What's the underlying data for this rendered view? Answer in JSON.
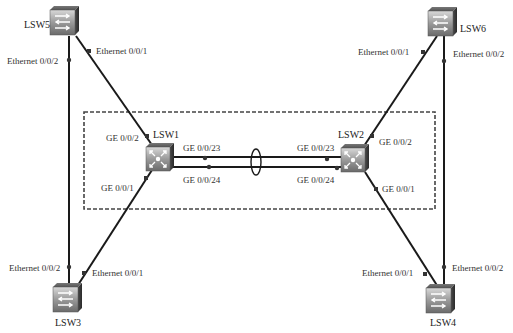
{
  "diagram": {
    "type": "network-topology",
    "group_box": {
      "style": "dashed",
      "contains": [
        "LSW1",
        "LSW2"
      ]
    },
    "devices": {
      "lsw1": {
        "name": "LSW1",
        "kind": "core-switch"
      },
      "lsw2": {
        "name": "LSW2",
        "kind": "core-switch"
      },
      "lsw3": {
        "name": "LSW3",
        "kind": "access-switch"
      },
      "lsw4": {
        "name": "LSW4",
        "kind": "access-switch"
      },
      "lsw5": {
        "name": "LSW5",
        "kind": "access-switch"
      },
      "lsw6": {
        "name": "LSW6",
        "kind": "access-switch"
      }
    },
    "ports": {
      "lsw5_e1": "Ethernet 0/0/1",
      "lsw5_e2": "Ethernet 0/0/2",
      "lsw6_e1": "Ethernet 0/0/1",
      "lsw6_e2": "Ethernet 0/0/2",
      "lsw3_e2": "Ethernet 0/0/2",
      "lsw3_e1": "Ethernet 0/0/1",
      "lsw4_e1": "Ethernet 0/0/1",
      "lsw4_e2": "Ethernet 0/0/2",
      "lsw1_g2": "GE 0/0/2",
      "lsw1_g1": "GE 0/0/1",
      "lsw1_g23": "GE 0/0/23",
      "lsw1_g24": "GE 0/0/24",
      "lsw2_g23": "GE 0/0/23",
      "lsw2_g24": "GE 0/0/24",
      "lsw2_g2": "GE 0/0/2",
      "lsw2_g1": "GE 0/0/1"
    },
    "links": [
      {
        "from": "LSW5 Ethernet 0/0/1",
        "to": "LSW1 GE 0/0/2"
      },
      {
        "from": "LSW5 Ethernet 0/0/2",
        "to": "LSW3 Ethernet 0/0/2"
      },
      {
        "from": "LSW3 Ethernet 0/0/1",
        "to": "LSW1 GE 0/0/1"
      },
      {
        "from": "LSW6 Ethernet 0/0/1",
        "to": "LSW2 GE 0/0/2"
      },
      {
        "from": "LSW6 Ethernet 0/0/2",
        "to": "LSW4 Ethernet 0/0/2"
      },
      {
        "from": "LSW4 Ethernet 0/0/1",
        "to": "LSW2 GE 0/0/1"
      },
      {
        "from": "LSW1 GE 0/0/23",
        "to": "LSW2 GE 0/0/23",
        "aggregated": true
      },
      {
        "from": "LSW1 GE 0/0/24",
        "to": "LSW2 GE 0/0/24",
        "aggregated": true
      }
    ],
    "colors": {
      "line": "#1a1a1a",
      "box_dash": "#444444",
      "device_body": "#8a8a8a"
    }
  }
}
